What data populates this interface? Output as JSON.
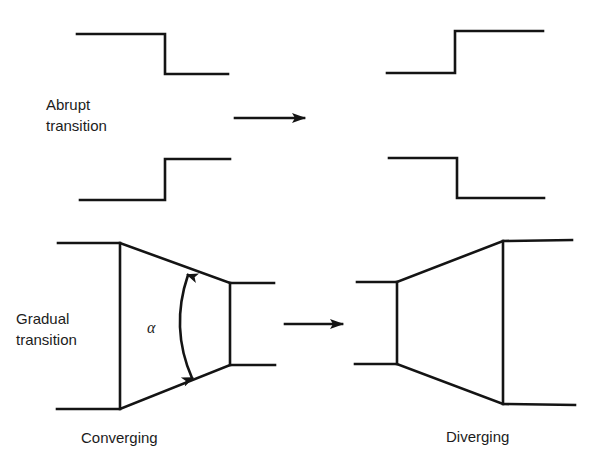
{
  "diagram": {
    "type": "flow-transition-schematic",
    "sections": [
      {
        "id": "abrupt",
        "label_line1": "Abrupt",
        "label_line2": "transition",
        "flow_direction": "left-to-right",
        "variants": [
          {
            "name": "contraction",
            "upper_wall": "step-down",
            "lower_wall": "step-up"
          },
          {
            "name": "expansion",
            "upper_wall": "step-up",
            "lower_wall": "step-down"
          }
        ]
      },
      {
        "id": "gradual",
        "label_line1": "Gradual",
        "label_line2": "transition",
        "flow_direction": "left-to-right",
        "variants": [
          {
            "name": "converging",
            "caption": "Converging",
            "angle_symbol": "α"
          },
          {
            "name": "diverging",
            "caption": "Diverging"
          }
        ]
      }
    ],
    "labels": {
      "abrupt_line1": "Abrupt",
      "abrupt_line2": "transition",
      "gradual_line1": "Gradual",
      "gradual_line2": "transition",
      "converging": "Converging",
      "diverging": "Diverging",
      "alpha": "α"
    },
    "colors": {
      "stroke": "#141414",
      "text": "#1c1c1c",
      "background": "#ffffff"
    }
  }
}
